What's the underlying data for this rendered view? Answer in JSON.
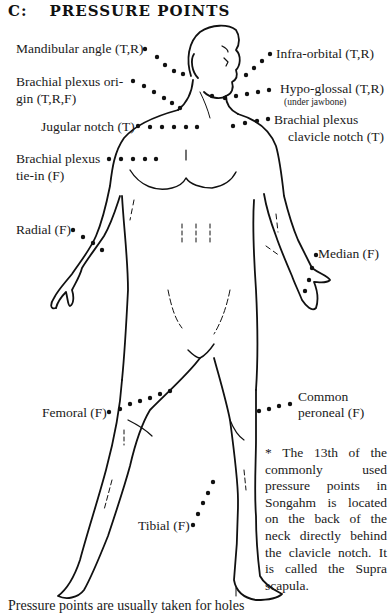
{
  "header": {
    "section": "C:",
    "title": "PRESSURE POINTS"
  },
  "labels": {
    "mandibular": "Mandibular angle (T,R)",
    "brachial_origin_1": "Brachial plexus ori-",
    "brachial_origin_2": "gin (T,R,F)",
    "jugular": "Jugular notch (T)",
    "brachial_tie_1": "Brachial plexus",
    "brachial_tie_2": "tie-in (F)",
    "radial": "Radial (F)",
    "infra_orbital": "Infra-orbital (T,R)",
    "hypo_glossal": "Hypo-glossal (T,R)",
    "hypo_glossal_sub": "(under jawbone)",
    "brachial_clavicle_1": "Brachial plexus",
    "brachial_clavicle_2": "clavicle notch (T)",
    "median": "Median (F)",
    "common_peroneal_1": "Common",
    "common_peroneal_2": "peroneal (F)",
    "femoral": "Femoral (F)",
    "tibial": "Tibial (F)"
  },
  "note": "* The 13th of the commonly used pressure points in Songahm is located on the back of the neck directly behind the clavicle notch. It is called the Supra scapula.",
  "footer": {
    "text": "Pressure points are usually taken for holes"
  },
  "colors": {
    "ink": "#111111",
    "background": "#ffffff"
  }
}
